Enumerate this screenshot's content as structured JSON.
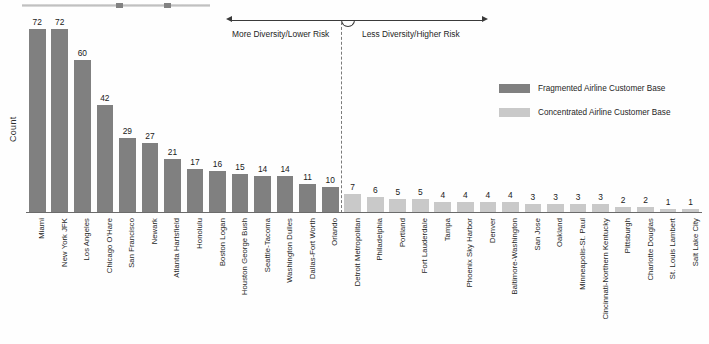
{
  "chart_data": {
    "type": "bar",
    "title": "",
    "subtitle": "",
    "xlabel": "",
    "ylabel": "Count",
    "ylim": [
      0,
      78
    ],
    "grid": false,
    "legend_position": "upper-right",
    "categories": [
      "Miami",
      "New York JFK",
      "Los Angeles",
      "Chicago O'Hare",
      "San Francisco",
      "Newark",
      "Atlanta Hartsfield",
      "Honolulu",
      "Boston Logan",
      "Houston George Bush",
      "Seattle-Tacoma",
      "Washington Dulles",
      "Dallas-Fort Worth",
      "Orlando",
      "Detroit Metropolitan",
      "Philadelphia",
      "Portland",
      "Fort Lauderdale",
      "Tampa",
      "Phoenix Sky Harbor",
      "Denver",
      "Baltimore-Washington",
      "San Jose",
      "Oakland",
      "Minneapolis-St. Paul",
      "Cincinnati-Northern Kentucky",
      "Pittsburgh",
      "Charlotte Douglas",
      "St. Louis Lambert",
      "Salt Lake City"
    ],
    "values": [
      72,
      72,
      60,
      42,
      29,
      27,
      21,
      17,
      16,
      15,
      14,
      14,
      11,
      10,
      7,
      6,
      5,
      5,
      4,
      4,
      4,
      4,
      3,
      3,
      3,
      3,
      2,
      2,
      1,
      1
    ],
    "groups": [
      "fragmented",
      "fragmented",
      "fragmented",
      "fragmented",
      "fragmented",
      "fragmented",
      "fragmented",
      "fragmented",
      "fragmented",
      "fragmented",
      "fragmented",
      "fragmented",
      "fragmented",
      "fragmented",
      "concentrated",
      "concentrated",
      "concentrated",
      "concentrated",
      "concentrated",
      "concentrated",
      "concentrated",
      "concentrated",
      "concentrated",
      "concentrated",
      "concentrated",
      "concentrated",
      "concentrated",
      "concentrated",
      "concentrated",
      "concentrated"
    ],
    "divider_after_category": "Orlando",
    "divider_index": 14,
    "colors": {
      "fragmented": "#808080",
      "concentrated": "#c9c9c9",
      "axis": "#6b6b6b",
      "divider": "#7a7a7a",
      "annotation": "#3a3a3a"
    }
  },
  "legend": {
    "items": [
      {
        "label": "Fragmented Airline Customer Base",
        "color": "#808080",
        "swatch_icon": "legend-swatch-dark"
      },
      {
        "label": "Concentrated Airline Customer Base",
        "color": "#c9c9c9",
        "swatch_icon": "legend-swatch-light"
      }
    ]
  },
  "annotation": {
    "left_text": "More Diversity/Lower Risk",
    "right_text": "Less Diversity/Higher Risk",
    "arrow_icon": "double-headed-arrow-icon"
  },
  "axes": {
    "y_title": "Count"
  }
}
